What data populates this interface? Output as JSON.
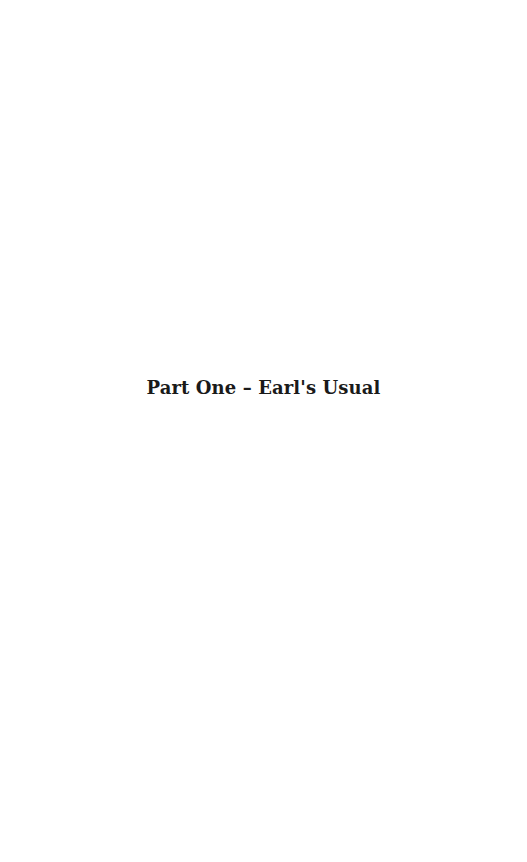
{
  "page": {
    "heading": "Part One – Earl's Usual"
  }
}
